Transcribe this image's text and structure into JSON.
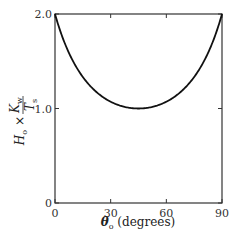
{
  "chart_data": {
    "type": "line",
    "title": "",
    "xlabel": "θ₀ (degrees)",
    "ylabel": "H₀ × K_w / T_s",
    "xlim": [
      0,
      90
    ],
    "ylim": [
      0,
      2.0
    ],
    "xticks": [
      0,
      30,
      60,
      90
    ],
    "xtick_labels": [
      "0",
      "30",
      "60",
      "90"
    ],
    "yticks": [
      0,
      1.0,
      2.0
    ],
    "ytick_labels": [
      "0",
      "1.0",
      "2.0"
    ],
    "grid": false,
    "legend": null,
    "series": [
      {
        "name": "H0*Kw/Ts",
        "x": [
          0,
          5,
          10,
          15,
          20,
          25,
          30,
          35,
          40,
          45,
          50,
          55,
          60,
          65,
          70,
          75,
          80,
          85,
          90
        ],
        "values": [
          2.0,
          1.7,
          1.49,
          1.33,
          1.22,
          1.13,
          1.07,
          1.03,
          1.01,
          1.0,
          1.01,
          1.03,
          1.07,
          1.13,
          1.22,
          1.33,
          1.49,
          1.7,
          2.0
        ]
      }
    ],
    "colors": {
      "line": "#111111",
      "frame": "#333333"
    }
  },
  "axes": {
    "x_label_theta": "θ",
    "x_label_sub": "o",
    "x_label_rest": " (degrees)",
    "y_label_H": "H",
    "y_label_H_sub": "o",
    "y_label_times": " × ",
    "y_label_num": "K",
    "y_label_num_sub": "w",
    "y_label_den": "T",
    "y_label_den_sub": "s"
  }
}
